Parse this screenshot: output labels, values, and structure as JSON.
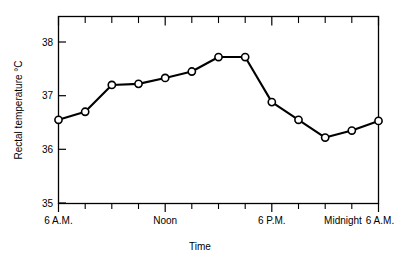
{
  "chart_data": {
    "type": "line",
    "title": "",
    "xlabel": "Time",
    "ylabel": "Rectal temperature  °C",
    "ylim": [
      35,
      38.4
    ],
    "yticks": [
      35,
      36,
      37,
      38
    ],
    "ytick_labels": [
      "35",
      "36",
      "37",
      "38"
    ],
    "grid": false,
    "legend": null,
    "x": [
      0,
      1,
      2,
      3,
      4,
      5,
      6,
      7,
      8,
      9,
      10,
      11,
      12
    ],
    "x_hours": [
      "6 A.M.",
      "8 A.M.",
      "10 A.M.",
      "Noon",
      "2 P.M.",
      "4 P.M.",
      "6 P.M.",
      "8 P.M.",
      "10 P.M.",
      "Midnight",
      "2 A.M.",
      "4 A.M.",
      "6 A.M."
    ],
    "values": [
      36.55,
      36.7,
      37.2,
      37.22,
      37.33,
      37.45,
      37.72,
      37.72,
      36.88,
      36.55,
      36.22,
      36.35,
      36.53
    ],
    "xtick_major_labels": [
      "6 A.M.",
      "Noon",
      "6 P.M.",
      "Midnight",
      "6 A.M."
    ],
    "xtick_major_positions": [
      0,
      3,
      6,
      9,
      12
    ],
    "minor_ticks_per_major": 3,
    "marker": "open-circle",
    "line_color": "#000000",
    "marker_fill": "#ffffff",
    "axis_color": "#000000"
  },
  "axes": {
    "y_title": "Rectal temperature  °C",
    "x_title": "Time"
  }
}
